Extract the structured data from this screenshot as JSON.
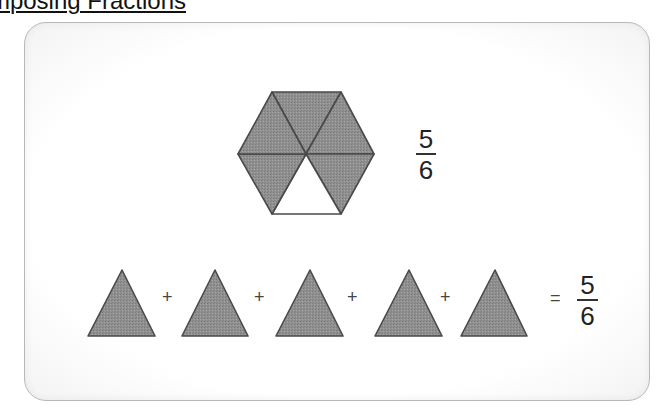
{
  "page": {
    "title": "Decomposing Fractions",
    "title_visible_fragment": "posing Fractions"
  },
  "colors": {
    "shape_fill": "#8e8e8e",
    "shape_stroke": "#4a4a4a",
    "unshaded_fill": "#ffffff",
    "card_border": "#b8b8b8"
  },
  "card": {
    "whole_shape": {
      "type": "hexagon",
      "parts_total": 6,
      "parts_shaded": 5,
      "fraction": {
        "numerator": "5",
        "denominator": "6"
      }
    },
    "equation": {
      "terms": [
        {
          "shape": "triangle",
          "label": "1/6"
        },
        {
          "shape": "triangle",
          "label": "1/6"
        },
        {
          "shape": "triangle",
          "label": "1/6"
        },
        {
          "shape": "triangle",
          "label": "1/6"
        },
        {
          "shape": "triangle",
          "label": "1/6"
        }
      ],
      "plus_symbol": "+",
      "equals_symbol": "=",
      "result": {
        "numerator": "5",
        "denominator": "6"
      }
    }
  }
}
